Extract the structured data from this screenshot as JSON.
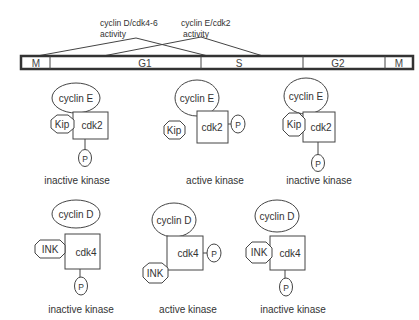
{
  "activity_labels": {
    "cyclin_d": {
      "line1": "cyclin D/cdk4-6",
      "line2": "activity"
    },
    "cyclin_e": {
      "line1": "cyclin E/cdk2",
      "line2": "activity"
    }
  },
  "cell_cycle": {
    "phases": [
      "M",
      "G1",
      "S",
      "G2",
      "M"
    ]
  },
  "row1": {
    "complexes": [
      {
        "cyclin": "cyclin E",
        "cdk": "cdk2",
        "inhibitor": "Kip",
        "phosphate": "P",
        "status": "inactive kinase"
      },
      {
        "cyclin": "cyclin E",
        "cdk": "cdk2",
        "inhibitor": "Kip",
        "phosphate": "P",
        "status": "active kinase"
      },
      {
        "cyclin": "cyclin E",
        "cdk": "cdk2",
        "inhibitor": "Kip",
        "phosphate": "P",
        "status": "inactive kinase"
      }
    ]
  },
  "row2": {
    "complexes": [
      {
        "cyclin": "cyclin D",
        "cdk": "cdk4",
        "inhibitor": "INK",
        "phosphate": "P",
        "status": "inactive kinase"
      },
      {
        "cyclin": "cyclin D",
        "cdk": "cdk4",
        "inhibitor": "INK",
        "phosphate": "P",
        "status": "active kinase"
      },
      {
        "cyclin": "cyclin D",
        "cdk": "cdk4",
        "inhibitor": "INK",
        "phosphate": "P",
        "status": "inactive kinase"
      }
    ]
  },
  "colors": {
    "stroke": "#444444",
    "text": "#333333",
    "background": "#ffffff"
  }
}
